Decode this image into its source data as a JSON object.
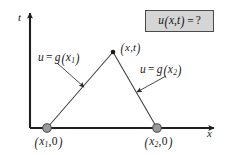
{
  "figure": {
    "name": "domain-of-dependence-diagram",
    "background_color": "#ffffff",
    "line_color": "#3c3c3c",
    "marker_fill": "#9a9a9a",
    "marker_stroke": "#4a4a4a",
    "box_fill": "#d5d5d5",
    "box_stroke": "#4a4a4a"
  },
  "axes": {
    "vertical_label": "t",
    "horizontal_label": "x"
  },
  "question_box": {
    "u": "u",
    "open": "(",
    "x": "x",
    "comma": ",",
    "t": "t",
    "close": ")",
    "equals": "=",
    "query": "?"
  },
  "labels": {
    "left_characteristic": {
      "u": "u",
      "equals": "=",
      "g": "g",
      "open": "(",
      "x": "x",
      "sub": "1",
      "close": ")"
    },
    "right_characteristic": {
      "u": "u",
      "equals": "=",
      "g": "g",
      "open": "(",
      "x": "x",
      "sub": "2",
      "close": ")"
    },
    "apex_point": {
      "open": "(",
      "x": "x",
      "comma": ",",
      "t": "t",
      "close": ")"
    },
    "base_left_point": {
      "open": "(",
      "x": "x",
      "sub": "1",
      "comma": ",",
      "zero": "0",
      "close": ")"
    },
    "base_right_point": {
      "open": "(",
      "x": "x",
      "sub": "2",
      "comma": ",",
      "zero": "0",
      "close": ")"
    }
  },
  "geometry": {
    "apex": {
      "x": 113,
      "y": 52
    },
    "base_left": {
      "x": 47,
      "y": 128
    },
    "base_right": {
      "x": 157,
      "y": 128
    },
    "origin": {
      "x": 30,
      "y": 128
    },
    "t_axis_top": {
      "x": 30,
      "y": 10
    },
    "x_axis_right": {
      "x": 221,
      "y": 128
    }
  }
}
